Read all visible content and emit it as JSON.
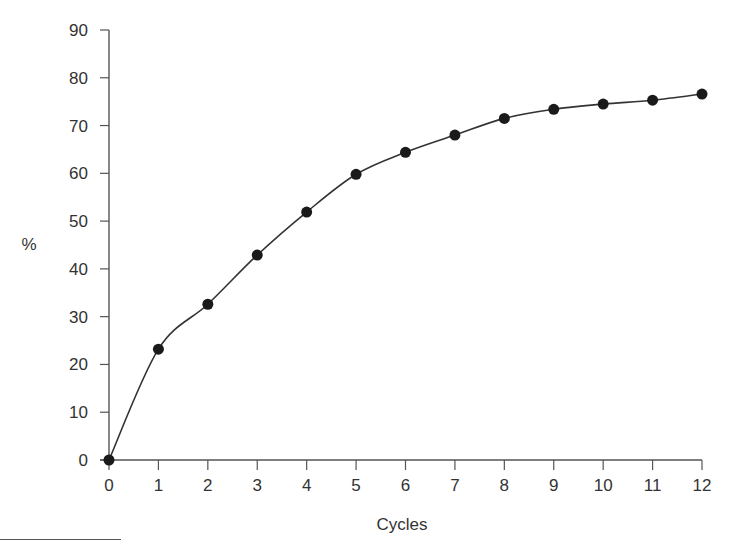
{
  "chart_data": {
    "type": "line",
    "title": "",
    "xlabel": "Cycles",
    "ylabel": "%",
    "x": [
      0,
      1,
      2,
      3,
      4,
      5,
      6,
      7,
      8,
      9,
      10,
      11,
      12
    ],
    "series": [
      {
        "name": "",
        "values": [
          0,
          23.2,
          32.6,
          42.9,
          51.9,
          59.8,
          64.4,
          68.0,
          71.5,
          73.4,
          74.5,
          75.3,
          76.6
        ],
        "marker": "filled-circle",
        "color": "#1a1a1a"
      }
    ],
    "xlim": [
      0,
      12
    ],
    "ylim": [
      0,
      90
    ],
    "xticks": [
      "0",
      "1",
      "2",
      "3",
      "4",
      "5",
      "6",
      "7",
      "8",
      "9",
      "10",
      "11",
      "12"
    ],
    "yticks": [
      "0",
      "10",
      "20",
      "30",
      "40",
      "50",
      "60",
      "70",
      "80",
      "90"
    ],
    "grid": false,
    "legend": null
  },
  "layout": {
    "plot_left": 109,
    "plot_right": 702,
    "plot_top": 30,
    "plot_bottom": 460,
    "axis_color": "#555555",
    "line_color": "#333333"
  }
}
